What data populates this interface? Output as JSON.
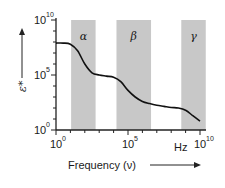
{
  "chart_data": {
    "type": "line",
    "title": "",
    "xlabel": "Frequency (ν)",
    "x_unit": "Hz",
    "ylabel": "ε*",
    "x_scale": "log",
    "y_scale": "log",
    "xlim": [
      1,
      10000000000
    ],
    "ylim": [
      1,
      10000000000
    ],
    "x_ticks": [
      {
        "base": "10",
        "exp": "0"
      },
      {
        "base": "10",
        "exp": "5"
      },
      {
        "base": "10",
        "exp": "10"
      }
    ],
    "y_ticks": [
      {
        "base": "10",
        "exp": "0"
      },
      {
        "base": "10",
        "exp": "5"
      },
      {
        "base": "10",
        "exp": "10"
      }
    ],
    "grid": false,
    "series": [
      {
        "name": "ε*",
        "x_log10": [
          0,
          0.5,
          1.0,
          1.5,
          2.0,
          2.5,
          3.0,
          3.5,
          4.0,
          4.5,
          5.0,
          5.5,
          6.0,
          6.5,
          7.0,
          7.5,
          8.0,
          8.5,
          9.0,
          9.5,
          10.0
        ],
        "y_log10": [
          7.9,
          7.9,
          7.8,
          7.2,
          6.0,
          5.2,
          5.0,
          4.9,
          4.8,
          4.4,
          3.6,
          3.0,
          2.6,
          2.4,
          2.25,
          2.15,
          2.05,
          2.0,
          1.8,
          1.3,
          0.8
        ]
      }
    ],
    "regions": [
      {
        "label": "α",
        "x_log10_range": [
          1.05,
          2.75
        ]
      },
      {
        "label": "β",
        "x_log10_range": [
          4.2,
          6.6
        ]
      },
      {
        "label": "γ",
        "x_log10_range": [
          8.7,
          10.4
        ]
      }
    ],
    "colors": {
      "region": "#c8c8c8",
      "curve": "#111111",
      "axis": "#222222"
    }
  }
}
